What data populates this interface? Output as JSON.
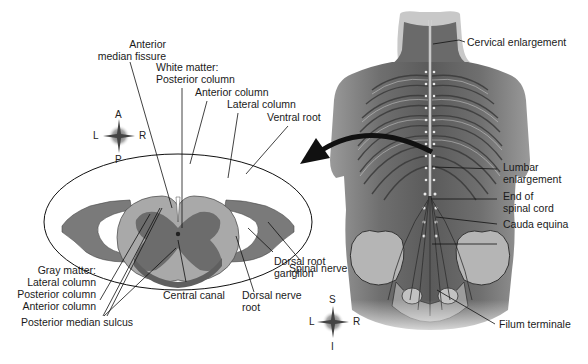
{
  "cross_section": {
    "labels": {
      "anterior_median_fissure_1": "Anterior",
      "anterior_median_fissure_2": "median fissure",
      "white_matter_1": "White matter:",
      "white_matter_2": "Posterior column",
      "anterior_column": "Anterior column",
      "lateral_column": "Lateral column",
      "ventral_root": "Ventral root",
      "spinal_nerve": "Spinal nerve",
      "dorsal_root_ganglion_1": "Dorsal root",
      "dorsal_root_ganglion_2": "ganglion",
      "dorsal_nerve_root_1": "Dorsal nerve",
      "dorsal_nerve_root_2": "root",
      "central_canal": "Central canal",
      "gray_matter": "Gray matter:",
      "gray_lateral_column": "Lateral column",
      "gray_posterior_column": "Posterior column",
      "gray_anterior_column": "Anterior column",
      "posterior_median_sulcus": "Posterior median sulcus"
    },
    "compass": {
      "top": "A",
      "left": "L",
      "right": "R",
      "bottom": "P"
    }
  },
  "body_view": {
    "labels": {
      "cervical_enlargement": "Cervical enlargement",
      "lumbar_enlargement_1": "Lumbar",
      "lumbar_enlargement_2": "enlargement",
      "end_of_spinal_cord_1": "End of",
      "end_of_spinal_cord_2": "spinal cord",
      "cauda_equina": "Cauda equina",
      "filum_terminale": "Filum terminale"
    },
    "compass": {
      "top": "S",
      "left": "L",
      "right": "R",
      "bottom": "I"
    }
  },
  "colors": {
    "white_matter": "#a9a9a9",
    "gray_matter": "#6e6e6e",
    "nerve": "#7a7a7a",
    "skin": "#8c8c8c",
    "arrow": "#111111"
  }
}
